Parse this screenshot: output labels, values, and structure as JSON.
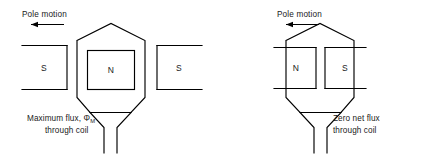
{
  "figure": {
    "type": "physics-diagram",
    "background_color": "#ffffff",
    "line_color": "#000000",
    "text_color": "#1a1a1a"
  },
  "left_diagram": {
    "name": "maximum-flux-position",
    "pole_motion_label": "Pole motion",
    "pole_motion_direction": "left",
    "caption_line1": "Maximum flux,",
    "caption_symbol": "Φ",
    "caption_subscript": "M",
    "caption_line2": "through coil",
    "poles": [
      {
        "label": "S",
        "position": "left",
        "open_side": "left"
      },
      {
        "label": "N",
        "position": "center",
        "open_side": "none"
      },
      {
        "label": "S",
        "position": "right",
        "open_side": "right"
      }
    ],
    "coil_shape": "hexagon",
    "coil_leads": 2
  },
  "right_diagram": {
    "name": "zero-net-flux-position",
    "pole_motion_label": "Pole motion",
    "pole_motion_direction": "left",
    "caption_line1": "Zero net flux",
    "caption_line2": "through coil",
    "poles": [
      {
        "label": "N",
        "position": "left",
        "open_side": "left"
      },
      {
        "label": "S",
        "position": "right",
        "open_side": "right"
      }
    ],
    "coil_shape": "hexagon",
    "coil_leads": 2
  }
}
